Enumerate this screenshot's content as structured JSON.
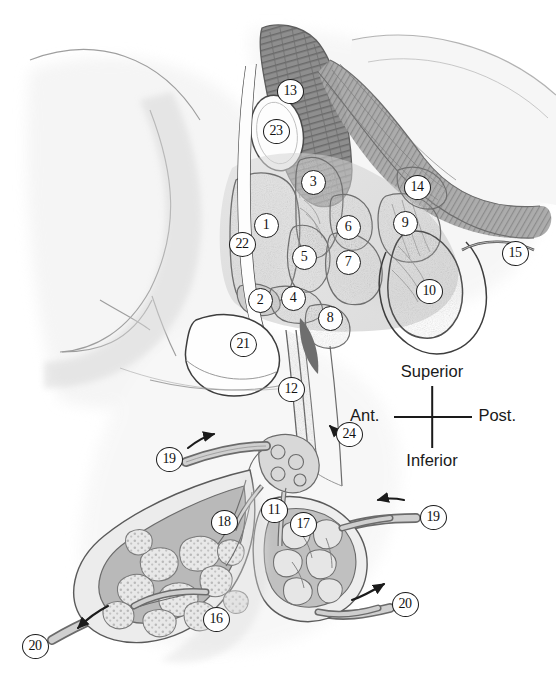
{
  "figure": {
    "style": "grayscale pencil and halftone medical illustration",
    "width": 556,
    "height": 680,
    "background_color": "#ffffff",
    "ink_color": "#1b1b1b"
  },
  "orientation": {
    "name": "orientation-compass",
    "superior": "Superior",
    "inferior": "Inferior",
    "anterior": "Ant.",
    "posterior": "Post."
  },
  "callouts": [
    {
      "id": 1,
      "label": "1",
      "x": 266,
      "y": 225
    },
    {
      "id": 2,
      "label": "2",
      "x": 260,
      "y": 300
    },
    {
      "id": 3,
      "label": "3",
      "x": 313,
      "y": 182
    },
    {
      "id": 4,
      "label": "4",
      "x": 293,
      "y": 298
    },
    {
      "id": 5,
      "label": "5",
      "x": 304,
      "y": 257
    },
    {
      "id": 6,
      "label": "6",
      "x": 348,
      "y": 227
    },
    {
      "id": 7,
      "label": "7",
      "x": 348,
      "y": 262
    },
    {
      "id": 8,
      "label": "8",
      "x": 330,
      "y": 318
    },
    {
      "id": 9,
      "label": "9",
      "x": 405,
      "y": 223
    },
    {
      "id": 10,
      "label": "10",
      "x": 429,
      "y": 291
    },
    {
      "id": 11,
      "label": "11",
      "x": 274,
      "y": 510
    },
    {
      "id": 12,
      "label": "12",
      "x": 291,
      "y": 389
    },
    {
      "id": 13,
      "label": "13",
      "x": 290,
      "y": 91
    },
    {
      "id": 14,
      "label": "14",
      "x": 417,
      "y": 187
    },
    {
      "id": 15,
      "label": "15",
      "x": 515,
      "y": 253
    },
    {
      "id": 16,
      "label": "16",
      "x": 216,
      "y": 619
    },
    {
      "id": 17,
      "label": "17",
      "x": 303,
      "y": 524
    },
    {
      "id": 18,
      "label": "18",
      "x": 224,
      "y": 522
    },
    {
      "id": 19,
      "label": "19",
      "x": 169,
      "y": 459
    },
    {
      "id": 20,
      "label": "20",
      "x": 35,
      "y": 646
    },
    {
      "id": 21,
      "label": "21",
      "x": 243,
      "y": 344
    },
    {
      "id": 22,
      "label": "22",
      "x": 242,
      "y": 244
    },
    {
      "id": 23,
      "label": "23",
      "x": 276,
      "y": 131
    },
    {
      "id": 24,
      "label": "24",
      "x": 349,
      "y": 434
    },
    {
      "id": 25,
      "label": "19",
      "x": 433,
      "y": 517
    },
    {
      "id": 26,
      "label": "20",
      "x": 405,
      "y": 604
    }
  ],
  "flow_arrows": [
    {
      "name": "arrow-inflow-left",
      "direction": "up-right"
    },
    {
      "name": "arrow-inflow-right",
      "direction": "left"
    },
    {
      "name": "arrow-outflow-lower-left",
      "direction": "down-left"
    },
    {
      "name": "arrow-outflow-lower-right",
      "direction": "up-right"
    },
    {
      "name": "arrow-leader-24",
      "direction": "up-left"
    }
  ],
  "structures": [
    {
      "name": "background-soft-tissue",
      "tone": "very light pencil shading"
    },
    {
      "name": "striated-muscle-band",
      "tone": "dark striated fibers"
    },
    {
      "name": "gland-lobules-left",
      "tone": "stippled cellular lobules"
    },
    {
      "name": "gland-lobules-right",
      "tone": "smooth pale lobules"
    },
    {
      "name": "duct-bundle",
      "tone": "parallel linear ducts"
    },
    {
      "name": "vascular-plexus",
      "tone": "branching network"
    }
  ]
}
